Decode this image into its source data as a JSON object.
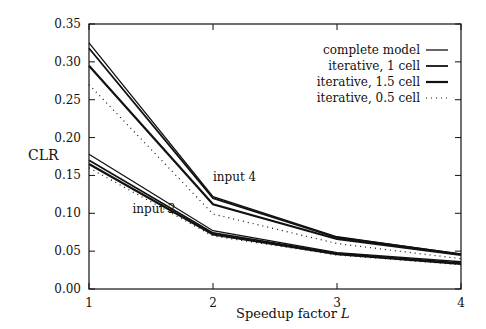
{
  "chart_data": {
    "type": "line",
    "title": "",
    "xlabel": "Speedup factor L",
    "ylabel": "CLR",
    "x": [
      1,
      2,
      3,
      4
    ],
    "xticks": [
      "1",
      "2",
      "3",
      "4"
    ],
    "yticks": [
      "0.00",
      "0.05",
      "0.10",
      "0.15",
      "0.20",
      "0.25",
      "0.30",
      "0.35"
    ],
    "xlim": [
      1,
      4
    ],
    "ylim": [
      0.0,
      0.35
    ],
    "grid": false,
    "legend_position": "upper right",
    "legend": [
      {
        "label": "complete model",
        "style": "solid-thin"
      },
      {
        "label": "iterative, 1 cell",
        "style": "solid"
      },
      {
        "label": "iterative, 1.5 cell",
        "style": "solid-thick"
      },
      {
        "label": "iterative, 0.5 cell",
        "style": "dotted"
      }
    ],
    "annotations": [
      {
        "text": "input 4",
        "x": 2.0,
        "y": 0.143
      },
      {
        "text": "input 2",
        "x": 1.35,
        "y": 0.1
      }
    ],
    "groups": [
      {
        "name": "input 4",
        "series": [
          {
            "name": "complete model",
            "values": [
              0.325,
              0.122,
              0.069,
              0.046
            ]
          },
          {
            "name": "iterative, 1 cell",
            "values": [
              0.318,
              0.12,
              0.068,
              0.046
            ]
          },
          {
            "name": "iterative, 1.5 cell",
            "values": [
              0.295,
              0.112,
              0.066,
              0.045
            ]
          },
          {
            "name": "iterative, 0.5 cell",
            "values": [
              0.27,
              0.099,
              0.06,
              0.04
            ]
          }
        ]
      },
      {
        "name": "input 2",
        "series": [
          {
            "name": "complete model",
            "values": [
              0.178,
              0.077,
              0.048,
              0.036
            ]
          },
          {
            "name": "iterative, 1 cell",
            "values": [
              0.17,
              0.074,
              0.047,
              0.034
            ]
          },
          {
            "name": "iterative, 1.5 cell",
            "values": [
              0.165,
              0.072,
              0.046,
              0.033
            ]
          },
          {
            "name": "iterative, 0.5 cell",
            "values": [
              0.16,
              0.07,
              0.045,
              0.032
            ]
          }
        ]
      }
    ]
  }
}
